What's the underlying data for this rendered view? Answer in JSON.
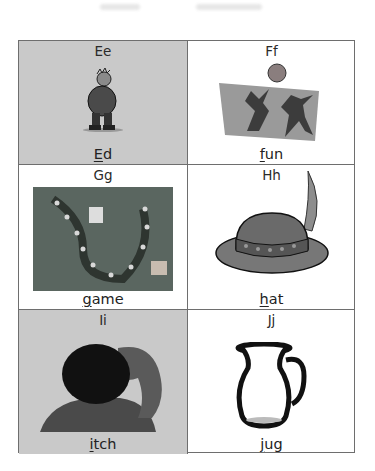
{
  "cards": [
    {
      "letter": "Ee",
      "word_first": "E",
      "word_rest": "d",
      "picture": "man-standing-illustration",
      "shaded": true
    },
    {
      "letter": "Ff",
      "word_first": "f",
      "word_rest": "un",
      "picture": "children-playing-ball-illustration",
      "shaded": false
    },
    {
      "letter": "Gg",
      "word_first": "g",
      "word_rest": "ame",
      "picture": "board-game-illustration",
      "shaded": false
    },
    {
      "letter": "Hh",
      "word_first": "h",
      "word_rest": "at",
      "picture": "feathered-hat-illustration",
      "shaded": false
    },
    {
      "letter": "Ii",
      "word_first": "i",
      "word_rest": "tch",
      "picture": "person-scratching-head-illustration",
      "shaded": true
    },
    {
      "letter": "Jj",
      "word_first": "j",
      "word_rest": "ug",
      "picture": "jug-illustration",
      "shaded": false
    }
  ],
  "colors": {
    "border": "#6e6e6e",
    "shaded_cell": "#c9c9c9",
    "text": "#222222"
  }
}
